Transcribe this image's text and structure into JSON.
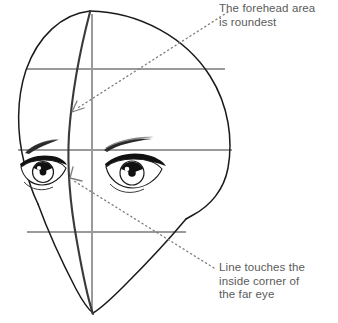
{
  "figure": {
    "colors": {
      "background": "#ffffff",
      "outline": "#1a1a1a",
      "guideline": "#9a9a9a",
      "centerline": "#3a3a3a",
      "leader": "#7d7d7d",
      "text": "#5b5b5b"
    }
  },
  "callouts": [
    {
      "id": "forehead",
      "text": "The forehead area\nis roundest",
      "leader_from": [
        228,
        12
      ],
      "leader_to": [
        74,
        110
      ],
      "arrow": true
    },
    {
      "id": "far-eye",
      "text": "Line touches the\ninside corner of\nthe far eye",
      "leader_from": [
        214,
        268
      ],
      "leader_to": [
        71,
        179
      ],
      "arrow": true
    }
  ],
  "guidelines": {
    "horizontal": [
      {
        "name": "hairline-guide",
        "y": 69
      },
      {
        "name": "brow-guide",
        "y": 150
      },
      {
        "name": "nose-guide",
        "y": 232
      }
    ],
    "vertical": [
      {
        "name": "center-axis-guide",
        "x": 92
      }
    ],
    "centerline": {
      "name": "facial-centerline",
      "description": "curved vertical line following the form of the face"
    }
  },
  "features": [
    {
      "name": "head-outline"
    },
    {
      "name": "jawline"
    },
    {
      "name": "left-eye"
    },
    {
      "name": "right-eye"
    },
    {
      "name": "left-eyebrow"
    },
    {
      "name": "right-eyebrow"
    }
  ]
}
